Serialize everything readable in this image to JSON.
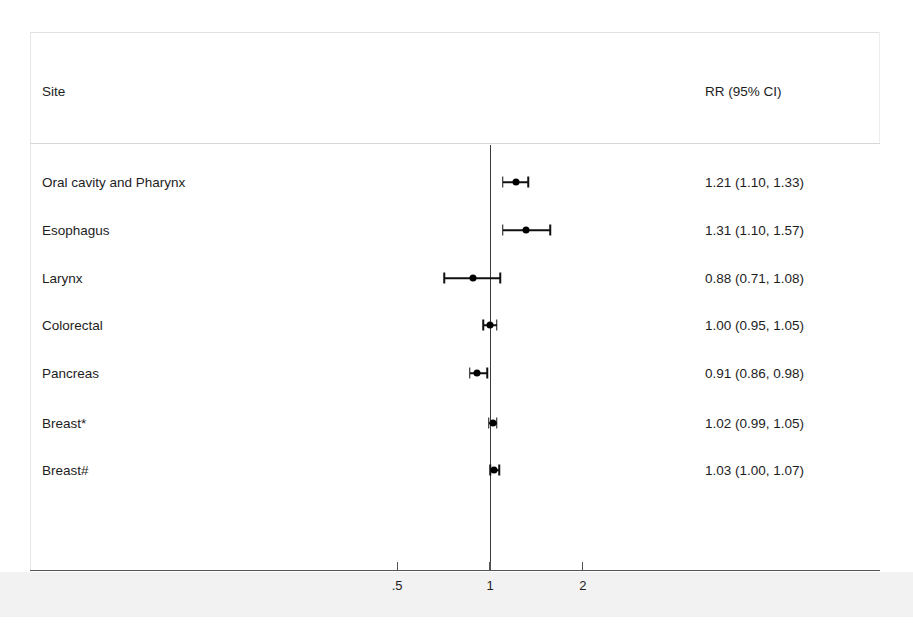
{
  "header": {
    "site_label": "Site",
    "estimate_label": "RR (95% CI)"
  },
  "axis": {
    "ticks": [
      {
        "label": ".5",
        "value": 0.5
      },
      {
        "label": "1",
        "value": 1
      },
      {
        "label": "2",
        "value": 2
      }
    ],
    "scale": "log10",
    "null_value": 1,
    "pixel_origin_x": 490,
    "pixel_per_decade": 308.6,
    "xmin": 0.38,
    "xmax": 2.6
  },
  "rows": [
    {
      "site": "Oral cavity and Pharynx",
      "estimate_text": "1.21 (1.10, 1.33)",
      "rr": 1.21,
      "lower": 1.1,
      "upper": 1.33,
      "y": 182
    },
    {
      "site": "Esophagus",
      "estimate_text": "1.31 (1.10, 1.57)",
      "rr": 1.31,
      "lower": 1.1,
      "upper": 1.57,
      "y": 230
    },
    {
      "site": "Larynx",
      "estimate_text": "0.88 (0.71, 1.08)",
      "rr": 0.88,
      "lower": 0.71,
      "upper": 1.08,
      "y": 278
    },
    {
      "site": "Colorectal",
      "estimate_text": "1.00 (0.95, 1.05)",
      "rr": 1.0,
      "lower": 0.95,
      "upper": 1.05,
      "y": 325
    },
    {
      "site": "Pancreas",
      "estimate_text": "0.91 (0.86, 0.98)",
      "rr": 0.91,
      "lower": 0.86,
      "upper": 0.98,
      "y": 373
    },
    {
      "site": "Breast*",
      "estimate_text": "1.02 (0.99, 1.05)",
      "rr": 1.02,
      "lower": 0.99,
      "upper": 1.05,
      "y": 423
    },
    {
      "site": "Breast#",
      "estimate_text": "1.03 (1.00, 1.07)",
      "rr": 1.03,
      "lower": 1.0,
      "upper": 1.07,
      "y": 470
    }
  ],
  "chart_data": {
    "type": "scatter",
    "subtype": "forest-plot",
    "title": "",
    "xlabel": "",
    "ylabel": "",
    "xscale": "log",
    "xlim": [
      0.38,
      2.6
    ],
    "xticks": [
      0.5,
      1,
      2
    ],
    "xticklabels": [
      ".5",
      "1",
      "2"
    ],
    "grid": false,
    "legend": "none",
    "reference_line": 1,
    "columns": [
      "Site",
      "RR (95% CI)"
    ],
    "categories": [
      "Oral cavity and Pharynx",
      "Esophagus",
      "Larynx",
      "Colorectal",
      "Pancreas",
      "Breast*",
      "Breast#"
    ],
    "values": [
      1.21,
      1.31,
      0.88,
      1.0,
      0.91,
      1.02,
      1.03
    ],
    "ci_lower": [
      1.1,
      1.1,
      0.71,
      0.95,
      0.86,
      0.99,
      1.0
    ],
    "ci_upper": [
      1.33,
      1.57,
      1.08,
      1.05,
      0.98,
      1.05,
      1.07
    ],
    "labels": [
      "1.21 (1.10, 1.33)",
      "1.31 (1.10, 1.57)",
      "0.88 (0.71, 1.08)",
      "1.00 (0.95, 1.05)",
      "0.91 (0.86, 0.98)",
      "1.02 (0.99, 1.05)",
      "1.03 (1.00, 1.07)"
    ],
    "colors": {
      "marker": "#000000",
      "line": "#111111",
      "axis": "#555555"
    }
  }
}
